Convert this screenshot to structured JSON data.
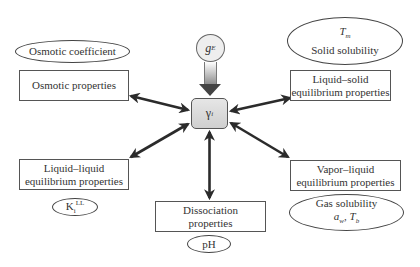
{
  "diagram": {
    "center": {
      "symbol": "γ",
      "subscript": "i"
    },
    "source": {
      "symbol": "g",
      "superscript": "E"
    },
    "nodes": [
      {
        "id": "osmotic",
        "label": "Osmotic properties",
        "annotation": "Osmotic coefficient"
      },
      {
        "id": "liquid-solid",
        "label_line1": "Liquid–solid",
        "label_line2": "equilibrium properties",
        "annotation_line1": "T",
        "annotation_line1_sub": "m",
        "annotation_line2": "Solid solubility"
      },
      {
        "id": "liquid-liquid",
        "label_line1": "Liquid–liquid",
        "label_line2": "equilibrium properties",
        "annotation": "K",
        "annotation_sub": "i",
        "annotation_sup": "LL"
      },
      {
        "id": "dissociation",
        "label_line1": "Dissociation",
        "label_line2": "properties",
        "annotation": "pH"
      },
      {
        "id": "vapor-liquid",
        "label_line1": "Vapor–liquid",
        "label_line2": "equilibrium properties",
        "annotation_line1": "Gas solubility",
        "annotation_line2_a": "a",
        "annotation_line2_a_sub": "w",
        "annotation_line2_sep": ", ",
        "annotation_line2_b": "T",
        "annotation_line2_b_sub": "b"
      }
    ],
    "colors": {
      "arrow": "#2b2b2b",
      "border": "#555555",
      "center_fill": "#dcdcdc"
    }
  }
}
